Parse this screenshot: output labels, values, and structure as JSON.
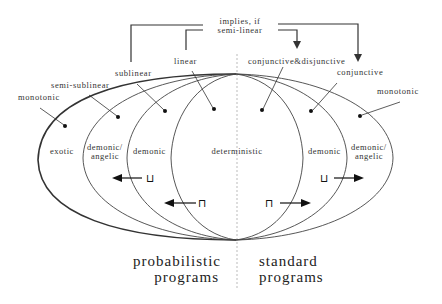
{
  "diagram": {
    "top_note": {
      "line1": "implies, if",
      "line2": "semi-linear"
    },
    "left_labels": {
      "monotonic": "monotonic",
      "semi_sublinear": "semi-sublinear",
      "sublinear": "sublinear",
      "linear": "linear"
    },
    "right_labels": {
      "conj_disj": "conjunctive&disjunctive",
      "conjunctive": "conjunctive",
      "monotonic": "monotonic"
    },
    "regions": {
      "exotic": "exotic",
      "demonic_angelic_left_1": "demonic/",
      "demonic_angelic_left_2": "angelic",
      "demonic_left": "demonic",
      "deterministic": "deterministic",
      "demonic_right": "demonic",
      "demonic_angelic_right_1": "demonic/",
      "demonic_angelic_right_2": "angelic"
    },
    "operators": {
      "join_left": "⊔",
      "meet_left": "⊓",
      "meet_right": "⊓",
      "join_right": "⊔"
    },
    "bottom": {
      "left_1": "probabilistic",
      "left_2": "programs",
      "right_1": "standard",
      "right_2": "programs"
    },
    "colors": {
      "line": "#333333",
      "text": "#333333",
      "divider": "#bbbbbb"
    }
  }
}
